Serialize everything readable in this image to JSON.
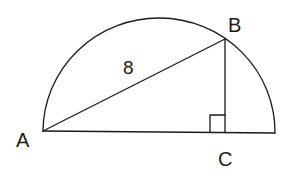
{
  "diagram": {
    "type": "geometry",
    "points": {
      "A": {
        "label": "A",
        "x": 43,
        "y": 131
      },
      "B": {
        "label": "B",
        "x": 225,
        "y": 39
      },
      "C": {
        "label": "C",
        "x": 225,
        "y": 132
      },
      "diameter_end": {
        "x": 275,
        "y": 133
      }
    },
    "segments": [
      {
        "from": "A",
        "to": "B",
        "label": "8"
      },
      {
        "from": "B",
        "to": "C",
        "label": ""
      },
      {
        "from": "A",
        "to": "diameter_end",
        "label": ""
      }
    ],
    "right_angle_marker": {
      "at": "C",
      "size": 15
    },
    "labels": {
      "A": "A",
      "B": "B",
      "C": "C",
      "AB_length": "8"
    },
    "colors": {
      "stroke": "#1a1a1a",
      "background": "#ffffff"
    }
  }
}
